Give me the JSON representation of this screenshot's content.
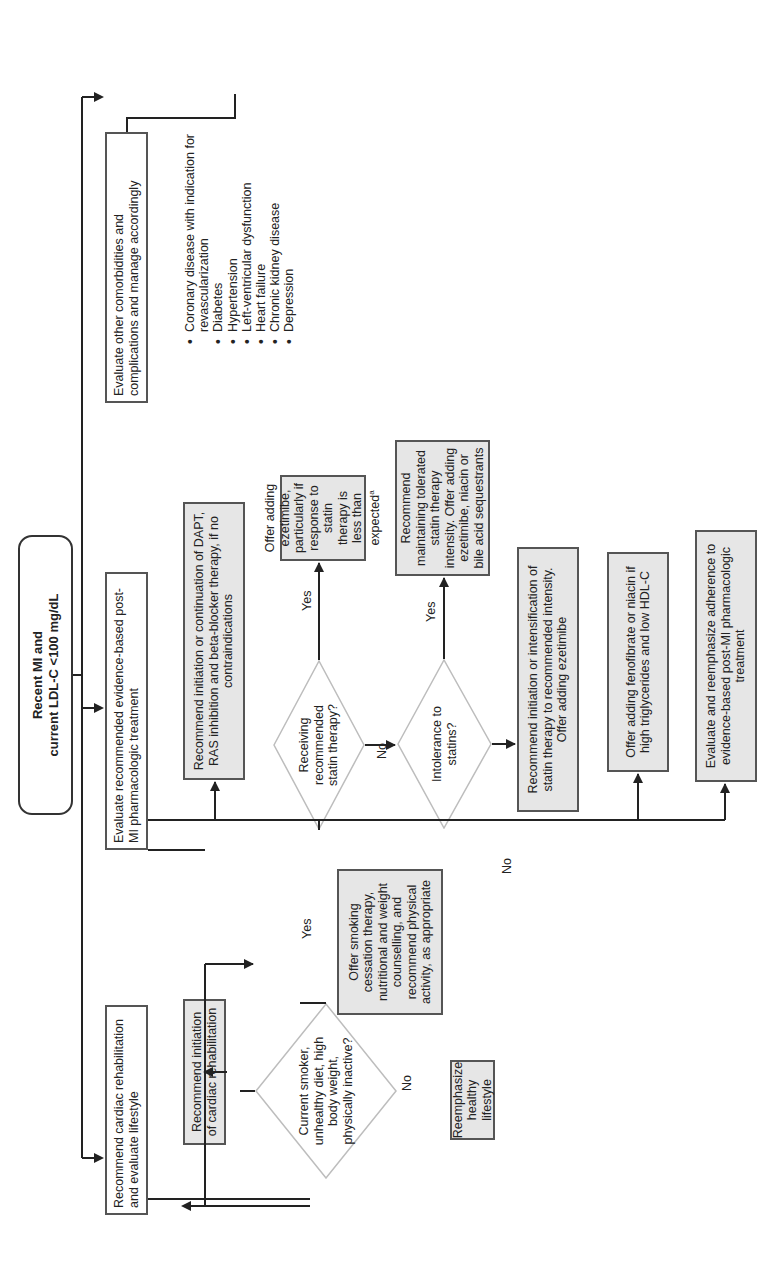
{
  "root": {
    "line1": "Recent MI and",
    "line2": "current LDL-C <100 mg/dL"
  },
  "columns": {
    "lifestyle": {
      "header": "Recommend cardiac rehabilitation and evaluate lifestyle",
      "rehab_box": "Recommend initiation of cardiac rehabilitation",
      "decision": "Current smoker, unhealthy diet, high body weight, physically inactive?",
      "yes_label": "Yes",
      "no_label": "No",
      "yes_box": "Offer smoking cessation therapy, nutritional and weight counselling, and recommend physical activity, as appropriate",
      "no_box": "Reemphasize healthy lifestyle"
    },
    "pharmacologic": {
      "header": "Evaluate recommended evidence-based post-MI pharmacologic treatment",
      "dapt_box": "Recommend initiation or continuation of DAPT, RAS inhibition and beta-blocker therapy, if no contraindications",
      "decision_statin": "Receiving recommended statin therapy?",
      "statin_yes_label": "Yes",
      "statin_no_label": "No",
      "statin_yes_box": "Offer adding ezetimibe, particularly if response to statin therapy is less than expected",
      "statin_yes_box_sup": "a",
      "decision_intolerance": "Intolerance to statins?",
      "intol_yes_label": "Yes",
      "intol_no_label": "No",
      "intol_yes_box": "Recommend maintaining tolerated statin therapy intensity. Offer adding ezetimibe, niacin or bile acid sequestrants",
      "intol_no_box": "Recommend initiation or intensification of statin therapy to recommended intensity. Offer adding ezetimibe",
      "fenofibrate_box": "Offer adding fenofibrate or niacin if high triglycerides and low HDL-C",
      "adherence_box": "Evaluate and reemphasize adherence to evidence-based post-MI pharmacologic treatment"
    },
    "comorbidities": {
      "header": "Evaluate other comorbidities and complications and manage accordingly",
      "items": [
        "Coronary disease with indication for revascularization",
        "Diabetes",
        "Hypertension",
        "Left-ventricular dysfunction",
        "Heart failure",
        "Chronic kidney disease",
        "Depression"
      ]
    }
  },
  "colors": {
    "line": "#222222",
    "box_border": "#555555",
    "grey_fill": "#e6e6e6",
    "diamond_stroke": "#bdbdbd"
  }
}
